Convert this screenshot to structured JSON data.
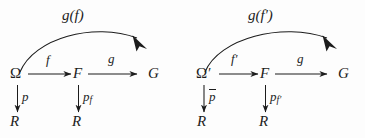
{
  "figure": {
    "type": "commutative-diagram",
    "background_color": "#fdfdfd",
    "ink_color": "#1c1c1c"
  },
  "left_diagram": {
    "curve_label": "g(f)",
    "nodes": {
      "source": "Ω",
      "middle": "F",
      "target": "G",
      "bottom_left": "R",
      "bottom_middle": "R"
    },
    "arrow_labels": {
      "horizontal_first": "f",
      "horizontal_second": "g",
      "vertical_left": "p",
      "vertical_middle_base": "p",
      "vertical_middle_sub": "f"
    }
  },
  "right_diagram": {
    "curve_label_base": "g(f",
    "curve_label_prime": "′",
    "curve_label_close": ")",
    "curve_label_full": "g(f′)",
    "nodes": {
      "source_base": "Ω",
      "source_prime": "′",
      "middle": "F",
      "target": "G",
      "bottom_left": "R",
      "bottom_middle": "R"
    },
    "arrow_labels": {
      "horizontal_first_base": "f",
      "horizontal_first_prime": "′",
      "horizontal_second": "g",
      "vertical_left_base": "p",
      "vertical_middle_base": "p",
      "vertical_middle_sub": "f",
      "vertical_middle_sub_prime": "′"
    }
  }
}
